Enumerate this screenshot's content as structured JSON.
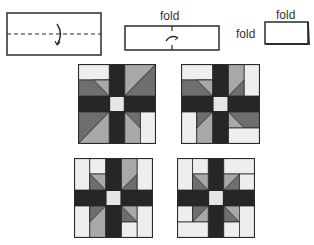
{
  "steps": [
    {
      "id": "step-1",
      "description": "Rectangle with horizontal dashed fold line and curved fold arrow"
    },
    {
      "id": "step-2",
      "description": "Folded strip with center crease",
      "label_top": "fold"
    },
    {
      "id": "step-3",
      "description": "Folded square",
      "label_top": "fold",
      "label_left": "fold"
    }
  ],
  "colors": {
    "outline": "#2b2b2b",
    "black": "#262626",
    "dark_gray": "#6e6e6e",
    "mid_gray": "#a8a8a8",
    "light": "#eeeeee",
    "center": "#e6e6e6"
  },
  "blocks": [
    {
      "id": "block-1",
      "variant": "pinwheel-triangles-A"
    },
    {
      "id": "block-2",
      "variant": "pinwheel-triangles-B"
    },
    {
      "id": "block-3",
      "variant": "strips-small-triangles-A"
    },
    {
      "id": "block-4",
      "variant": "strips-small-triangles-B"
    }
  ]
}
